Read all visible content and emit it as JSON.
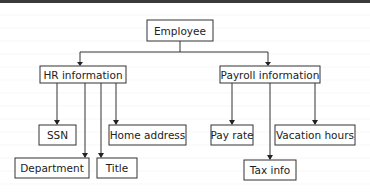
{
  "diagram": {
    "type": "tree",
    "nodes": [
      {
        "id": "employee",
        "label": "Employee"
      },
      {
        "id": "hr",
        "label": "HR information"
      },
      {
        "id": "payroll",
        "label": "Payroll information"
      },
      {
        "id": "ssn",
        "label": "SSN"
      },
      {
        "id": "home",
        "label": "Home address"
      },
      {
        "id": "dept",
        "label": "Department"
      },
      {
        "id": "title",
        "label": "Title"
      },
      {
        "id": "payrate",
        "label": "Pay rate"
      },
      {
        "id": "vacation",
        "label": "Vacation hours"
      },
      {
        "id": "tax",
        "label": "Tax info"
      }
    ],
    "edges": [
      {
        "from": "employee",
        "to": "hr"
      },
      {
        "from": "employee",
        "to": "payroll"
      },
      {
        "from": "hr",
        "to": "ssn"
      },
      {
        "from": "hr",
        "to": "home"
      },
      {
        "from": "hr",
        "to": "dept"
      },
      {
        "from": "hr",
        "to": "title"
      },
      {
        "from": "payroll",
        "to": "payrate"
      },
      {
        "from": "payroll",
        "to": "vacation"
      },
      {
        "from": "payroll",
        "to": "tax"
      }
    ]
  }
}
